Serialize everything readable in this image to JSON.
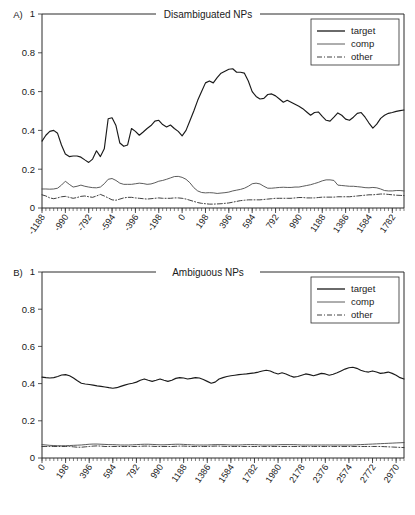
{
  "figure": {
    "panels": [
      {
        "letter": "A)",
        "title": "Disambiguated NPs"
      },
      {
        "letter": "B)",
        "title": "Ambiguous NPs"
      }
    ]
  },
  "legend": {
    "target_label": "target",
    "comp_label": "comp",
    "other_label": "other"
  },
  "chart_data": [
    {
      "type": "line",
      "panel": "A",
      "title": "Disambiguated NPs",
      "xlabel": "",
      "ylabel": "",
      "xlim": [
        -1188,
        1881
      ],
      "ylim": [
        0,
        1
      ],
      "grid": false,
      "legend_position": "top-right",
      "xticks": [
        -1188,
        -990,
        -792,
        -594,
        -396,
        -198,
        0,
        198,
        396,
        594,
        792,
        990,
        1188,
        1386,
        1584,
        1782
      ],
      "yticks": [
        0,
        0.2,
        0.4,
        0.6,
        0.8,
        1
      ],
      "x": [
        -1188,
        -1155,
        -1122,
        -1089,
        -1056,
        -1023,
        -990,
        -957,
        -924,
        -891,
        -858,
        -825,
        -792,
        -759,
        -726,
        -693,
        -660,
        -627,
        -594,
        -561,
        -528,
        -495,
        -462,
        -429,
        -396,
        -363,
        -330,
        -297,
        -264,
        -231,
        -198,
        -165,
        -132,
        -99,
        -66,
        -33,
        0,
        33,
        66,
        99,
        132,
        165,
        198,
        231,
        264,
        297,
        330,
        363,
        396,
        429,
        462,
        495,
        528,
        561,
        594,
        627,
        660,
        693,
        726,
        759,
        792,
        825,
        858,
        891,
        924,
        957,
        990,
        1023,
        1056,
        1089,
        1122,
        1155,
        1188,
        1221,
        1254,
        1287,
        1320,
        1353,
        1386,
        1419,
        1452,
        1485,
        1518,
        1551,
        1584,
        1617,
        1650,
        1683,
        1716,
        1749,
        1782,
        1815,
        1848,
        1881
      ],
      "series": [
        {
          "name": "target",
          "values": [
            0.345,
            0.375,
            0.395,
            0.4,
            0.385,
            0.325,
            0.278,
            0.265,
            0.268,
            0.268,
            0.262,
            0.248,
            0.235,
            0.252,
            0.295,
            0.265,
            0.305,
            0.46,
            0.465,
            0.425,
            0.335,
            0.318,
            0.325,
            0.41,
            0.395,
            0.375,
            0.392,
            0.41,
            0.425,
            0.448,
            0.452,
            0.43,
            0.418,
            0.428,
            0.41,
            0.395,
            0.372,
            0.4,
            0.45,
            0.5,
            0.555,
            0.6,
            0.645,
            0.655,
            0.645,
            0.672,
            0.695,
            0.705,
            0.715,
            0.718,
            0.7,
            0.7,
            0.695,
            0.655,
            0.6,
            0.575,
            0.562,
            0.565,
            0.585,
            0.588,
            0.578,
            0.562,
            0.545,
            0.555,
            0.545,
            0.535,
            0.525,
            0.512,
            0.495,
            0.478,
            0.492,
            0.495,
            0.472,
            0.452,
            0.448,
            0.468,
            0.49,
            0.478,
            0.458,
            0.452,
            0.468,
            0.488,
            0.492,
            0.468,
            0.438,
            0.412,
            0.432,
            0.462,
            0.478,
            0.488,
            0.492,
            0.498,
            0.502,
            0.505
          ]
        },
        {
          "name": "comp",
          "values": [
            0.098,
            0.098,
            0.097,
            0.098,
            0.102,
            0.118,
            0.138,
            0.122,
            0.108,
            0.112,
            0.118,
            0.112,
            0.108,
            0.105,
            0.104,
            0.108,
            0.125,
            0.148,
            0.152,
            0.142,
            0.128,
            0.122,
            0.122,
            0.122,
            0.125,
            0.128,
            0.126,
            0.122,
            0.124,
            0.13,
            0.138,
            0.142,
            0.148,
            0.155,
            0.162,
            0.163,
            0.158,
            0.148,
            0.13,
            0.105,
            0.088,
            0.08,
            0.078,
            0.079,
            0.078,
            0.075,
            0.077,
            0.079,
            0.082,
            0.088,
            0.092,
            0.096,
            0.102,
            0.112,
            0.125,
            0.128,
            0.124,
            0.112,
            0.102,
            0.102,
            0.104,
            0.106,
            0.107,
            0.106,
            0.106,
            0.108,
            0.108,
            0.112,
            0.116,
            0.12,
            0.126,
            0.132,
            0.14,
            0.145,
            0.145,
            0.142,
            0.118,
            0.116,
            0.114,
            0.112,
            0.112,
            0.11,
            0.108,
            0.105,
            0.104,
            0.106,
            0.104,
            0.098,
            0.09,
            0.088,
            0.088,
            0.09,
            0.09,
            0.088
          ]
        },
        {
          "name": "other",
          "values": [
            0.068,
            0.062,
            0.052,
            0.048,
            0.052,
            0.058,
            0.06,
            0.055,
            0.05,
            0.054,
            0.06,
            0.062,
            0.058,
            0.055,
            0.062,
            0.07,
            0.062,
            0.052,
            0.042,
            0.04,
            0.046,
            0.052,
            0.055,
            0.055,
            0.052,
            0.05,
            0.048,
            0.046,
            0.048,
            0.05,
            0.052,
            0.05,
            0.05,
            0.05,
            0.052,
            0.052,
            0.05,
            0.046,
            0.04,
            0.034,
            0.028,
            0.024,
            0.022,
            0.02,
            0.02,
            0.021,
            0.022,
            0.024,
            0.026,
            0.03,
            0.034,
            0.038,
            0.04,
            0.042,
            0.042,
            0.042,
            0.042,
            0.044,
            0.046,
            0.048,
            0.05,
            0.05,
            0.05,
            0.05,
            0.05,
            0.052,
            0.054,
            0.054,
            0.052,
            0.052,
            0.052,
            0.054,
            0.056,
            0.056,
            0.056,
            0.056,
            0.058,
            0.058,
            0.058,
            0.058,
            0.06,
            0.062,
            0.064,
            0.066,
            0.068,
            0.068,
            0.07,
            0.072,
            0.072,
            0.07,
            0.068,
            0.066,
            0.065,
            0.064
          ]
        }
      ]
    },
    {
      "type": "line",
      "panel": "B",
      "title": "Ambiguous NPs",
      "xlabel": "",
      "ylabel": "",
      "xlim": [
        0,
        3036
      ],
      "ylim": [
        0,
        1
      ],
      "grid": false,
      "legend_position": "top-right",
      "xticks": [
        0,
        198,
        396,
        594,
        792,
        990,
        1188,
        1386,
        1584,
        1782,
        1980,
        2178,
        2376,
        2574,
        2772,
        2970
      ],
      "yticks": [
        0,
        0.2,
        0.4,
        0.6,
        0.8,
        1
      ],
      "x": [
        0,
        33,
        66,
        99,
        132,
        165,
        198,
        231,
        264,
        297,
        330,
        363,
        396,
        429,
        462,
        495,
        528,
        561,
        594,
        627,
        660,
        693,
        726,
        759,
        792,
        825,
        858,
        891,
        924,
        957,
        990,
        1023,
        1056,
        1089,
        1122,
        1155,
        1188,
        1221,
        1254,
        1287,
        1320,
        1353,
        1386,
        1419,
        1452,
        1485,
        1518,
        1551,
        1584,
        1617,
        1650,
        1683,
        1716,
        1749,
        1782,
        1815,
        1848,
        1881,
        1914,
        1947,
        1980,
        2013,
        2046,
        2079,
        2112,
        2145,
        2178,
        2211,
        2244,
        2277,
        2310,
        2343,
        2376,
        2409,
        2442,
        2475,
        2508,
        2541,
        2574,
        2607,
        2640,
        2673,
        2706,
        2739,
        2772,
        2805,
        2838,
        2871,
        2904,
        2937,
        2970,
        3003,
        3036
      ],
      "series": [
        {
          "name": "target",
          "values": [
            0.435,
            0.432,
            0.43,
            0.432,
            0.438,
            0.446,
            0.448,
            0.442,
            0.43,
            0.415,
            0.402,
            0.398,
            0.395,
            0.392,
            0.388,
            0.385,
            0.382,
            0.378,
            0.375,
            0.378,
            0.385,
            0.392,
            0.398,
            0.402,
            0.408,
            0.418,
            0.425,
            0.418,
            0.412,
            0.418,
            0.425,
            0.418,
            0.412,
            0.418,
            0.428,
            0.432,
            0.43,
            0.425,
            0.428,
            0.432,
            0.43,
            0.422,
            0.412,
            0.402,
            0.408,
            0.425,
            0.432,
            0.438,
            0.442,
            0.445,
            0.448,
            0.45,
            0.452,
            0.455,
            0.458,
            0.462,
            0.468,
            0.472,
            0.468,
            0.458,
            0.452,
            0.458,
            0.452,
            0.442,
            0.435,
            0.438,
            0.445,
            0.452,
            0.448,
            0.442,
            0.448,
            0.455,
            0.452,
            0.445,
            0.45,
            0.458,
            0.468,
            0.478,
            0.485,
            0.488,
            0.482,
            0.472,
            0.465,
            0.462,
            0.468,
            0.462,
            0.455,
            0.458,
            0.462,
            0.455,
            0.445,
            0.432,
            0.425
          ]
        },
        {
          "name": "comp",
          "values": [
            0.072,
            0.07,
            0.068,
            0.067,
            0.066,
            0.066,
            0.066,
            0.067,
            0.068,
            0.069,
            0.07,
            0.072,
            0.074,
            0.075,
            0.075,
            0.074,
            0.073,
            0.072,
            0.072,
            0.071,
            0.07,
            0.07,
            0.07,
            0.071,
            0.072,
            0.073,
            0.074,
            0.074,
            0.073,
            0.072,
            0.071,
            0.071,
            0.072,
            0.073,
            0.074,
            0.074,
            0.073,
            0.072,
            0.071,
            0.07,
            0.07,
            0.07,
            0.07,
            0.071,
            0.072,
            0.072,
            0.072,
            0.071,
            0.07,
            0.07,
            0.07,
            0.071,
            0.072,
            0.072,
            0.072,
            0.071,
            0.07,
            0.07,
            0.07,
            0.07,
            0.071,
            0.072,
            0.072,
            0.072,
            0.072,
            0.071,
            0.07,
            0.07,
            0.07,
            0.07,
            0.07,
            0.07,
            0.07,
            0.07,
            0.07,
            0.07,
            0.07,
            0.07,
            0.07,
            0.07,
            0.071,
            0.072,
            0.073,
            0.074,
            0.075,
            0.076,
            0.077,
            0.078,
            0.079,
            0.08,
            0.081,
            0.082,
            0.083
          ]
        },
        {
          "name": "other",
          "values": [
            0.062,
            0.062,
            0.062,
            0.062,
            0.062,
            0.062,
            0.062,
            0.062,
            0.06,
            0.058,
            0.058,
            0.06,
            0.062,
            0.064,
            0.065,
            0.064,
            0.062,
            0.062,
            0.062,
            0.062,
            0.062,
            0.062,
            0.062,
            0.062,
            0.062,
            0.063,
            0.064,
            0.064,
            0.063,
            0.062,
            0.062,
            0.062,
            0.062,
            0.062,
            0.063,
            0.064,
            0.064,
            0.063,
            0.062,
            0.062,
            0.062,
            0.062,
            0.062,
            0.063,
            0.064,
            0.064,
            0.063,
            0.062,
            0.062,
            0.062,
            0.062,
            0.062,
            0.062,
            0.062,
            0.062,
            0.062,
            0.062,
            0.062,
            0.062,
            0.062,
            0.062,
            0.062,
            0.062,
            0.062,
            0.062,
            0.062,
            0.062,
            0.062,
            0.062,
            0.062,
            0.062,
            0.062,
            0.062,
            0.062,
            0.062,
            0.062,
            0.062,
            0.062,
            0.062,
            0.062,
            0.062,
            0.062,
            0.062,
            0.062,
            0.062,
            0.062,
            0.062,
            0.061,
            0.06,
            0.059,
            0.058,
            0.057,
            0.056
          ]
        }
      ]
    }
  ]
}
